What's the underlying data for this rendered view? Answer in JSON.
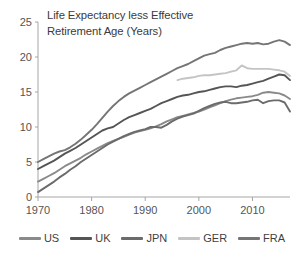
{
  "chart_data": {
    "type": "line",
    "title": "Life Expectancy less Effective\nRetirement Age (Years)",
    "title_line1": "Life Expectancy less Effective",
    "title_line2": "Retirement Age (Years)",
    "xlabel": "",
    "ylabel": "",
    "xlim": [
      1970,
      2017
    ],
    "ylim": [
      0,
      25
    ],
    "ytick_labels": [
      "0",
      "5",
      "10",
      "15",
      "20",
      "25"
    ],
    "ytick_values": [
      0,
      5,
      10,
      15,
      20,
      25
    ],
    "xtick_labels": [
      "1970",
      "1980",
      "1990",
      "2000",
      "2010"
    ],
    "xtick_values": [
      1970,
      1980,
      1990,
      2000,
      2010
    ],
    "grid": false,
    "legend_position": "bottom",
    "series": [
      {
        "name": "US",
        "color": "#8a8a8a",
        "x": [
          1970,
          1971,
          1972,
          1973,
          1974,
          1975,
          1976,
          1977,
          1978,
          1979,
          1980,
          1981,
          1982,
          1983,
          1984,
          1985,
          1986,
          1987,
          1988,
          1989,
          1990,
          1991,
          1992,
          1993,
          1994,
          1995,
          1996,
          1997,
          1998,
          1999,
          2000,
          2001,
          2002,
          2003,
          2004,
          2005,
          2006,
          2007,
          2008,
          2009,
          2010,
          2011,
          2012,
          2013,
          2014,
          2015,
          2016,
          2017
        ],
        "values": [
          2.2,
          2.6,
          3.0,
          3.4,
          3.9,
          4.4,
          4.8,
          5.2,
          5.6,
          6.1,
          6.5,
          6.9,
          7.3,
          7.7,
          8.0,
          8.3,
          8.6,
          8.9,
          9.2,
          9.4,
          9.6,
          9.8,
          10.1,
          10.4,
          10.8,
          11.1,
          11.4,
          11.6,
          11.8,
          12.0,
          12.2,
          12.5,
          12.8,
          13.1,
          13.4,
          13.7,
          13.9,
          14.1,
          14.2,
          14.3,
          14.4,
          14.6,
          14.9,
          15.0,
          14.9,
          14.8,
          14.5,
          14.0
        ]
      },
      {
        "name": "UK",
        "color": "#555555",
        "x": [
          1970,
          1971,
          1972,
          1973,
          1974,
          1975,
          1976,
          1977,
          1978,
          1979,
          1980,
          1981,
          1982,
          1983,
          1984,
          1985,
          1986,
          1987,
          1988,
          1989,
          1990,
          1991,
          1992,
          1993,
          1994,
          1995,
          1996,
          1997,
          1998,
          1999,
          2000,
          2001,
          2002,
          2003,
          2004,
          2005,
          2006,
          2007,
          2008,
          2009,
          2010,
          2011,
          2012,
          2013,
          2014,
          2015,
          2016,
          2017
        ],
        "values": [
          4.0,
          4.4,
          4.8,
          5.2,
          5.7,
          6.2,
          6.6,
          7.0,
          7.5,
          8.0,
          8.5,
          9.0,
          9.5,
          9.8,
          10.0,
          10.5,
          11.0,
          11.4,
          11.7,
          12.0,
          12.3,
          12.6,
          13.0,
          13.4,
          13.7,
          14.0,
          14.3,
          14.5,
          14.6,
          14.8,
          15.0,
          15.1,
          15.3,
          15.5,
          15.7,
          15.8,
          15.8,
          15.7,
          15.9,
          16.0,
          16.2,
          16.4,
          16.6,
          16.9,
          17.2,
          17.5,
          17.4,
          16.7
        ]
      },
      {
        "name": "JPN",
        "color": "#6b6b6b",
        "x": [
          1970,
          1971,
          1972,
          1973,
          1974,
          1975,
          1976,
          1977,
          1978,
          1979,
          1980,
          1981,
          1982,
          1983,
          1984,
          1985,
          1986,
          1987,
          1988,
          1989,
          1990,
          1991,
          1992,
          1993,
          1994,
          1995,
          1996,
          1997,
          1998,
          1999,
          2000,
          2001,
          2002,
          2003,
          2004,
          2005,
          2006,
          2007,
          2008,
          2009,
          2010,
          2011,
          2012,
          2013,
          2014,
          2015,
          2016,
          2017
        ],
        "values": [
          0.7,
          1.2,
          1.7,
          2.2,
          2.8,
          3.3,
          3.9,
          4.4,
          5.0,
          5.5,
          6.0,
          6.5,
          7.0,
          7.5,
          7.9,
          8.3,
          8.7,
          9.0,
          9.3,
          9.5,
          9.7,
          10.0,
          10.0,
          9.9,
          10.3,
          10.8,
          11.2,
          11.5,
          11.7,
          11.9,
          12.3,
          12.7,
          13.0,
          13.3,
          13.5,
          13.6,
          13.4,
          13.4,
          13.5,
          13.6,
          13.8,
          13.9,
          13.4,
          13.7,
          13.8,
          13.8,
          13.5,
          12.2
        ]
      },
      {
        "name": "GER",
        "color": "#c4c4c4",
        "x": [
          1996,
          1997,
          1998,
          1999,
          2000,
          2001,
          2002,
          2003,
          2004,
          2005,
          2006,
          2007,
          2008,
          2009,
          2010,
          2011,
          2012,
          2013,
          2014,
          2015,
          2016,
          2017
        ],
        "values": [
          16.7,
          16.9,
          17.0,
          17.1,
          17.3,
          17.4,
          17.4,
          17.5,
          17.6,
          17.7,
          17.9,
          18.1,
          18.8,
          18.4,
          18.3,
          18.3,
          18.3,
          18.3,
          18.2,
          18.1,
          17.9,
          17.3
        ]
      },
      {
        "name": "FRA",
        "color": "#757575",
        "x": [
          1970,
          1971,
          1972,
          1973,
          1974,
          1975,
          1976,
          1977,
          1978,
          1979,
          1980,
          1981,
          1982,
          1983,
          1984,
          1985,
          1986,
          1987,
          1988,
          1989,
          1990,
          1991,
          1992,
          1993,
          1994,
          1995,
          1996,
          1997,
          1998,
          1999,
          2000,
          2001,
          2002,
          2003,
          2004,
          2005,
          2006,
          2007,
          2008,
          2009,
          2010,
          2011,
          2012,
          2013,
          2014,
          2015,
          2016,
          2017
        ],
        "values": [
          5.0,
          5.4,
          5.8,
          6.2,
          6.5,
          6.7,
          7.1,
          7.6,
          8.2,
          8.9,
          9.6,
          10.4,
          11.3,
          12.2,
          13.0,
          13.7,
          14.3,
          14.8,
          15.2,
          15.6,
          16.0,
          16.4,
          16.8,
          17.2,
          17.6,
          18.0,
          18.4,
          18.7,
          19.0,
          19.4,
          19.8,
          20.2,
          20.4,
          20.6,
          21.0,
          21.3,
          21.5,
          21.7,
          21.9,
          22.0,
          21.9,
          22.0,
          21.8,
          21.9,
          22.2,
          22.4,
          22.2,
          21.7
        ]
      }
    ]
  },
  "legend": {
    "items": [
      {
        "label": "US",
        "color": "#8a8a8a"
      },
      {
        "label": "UK",
        "color": "#555555"
      },
      {
        "label": "JPN",
        "color": "#6b6b6b"
      },
      {
        "label": "GER",
        "color": "#c4c4c4"
      },
      {
        "label": "FRA",
        "color": "#757575"
      }
    ]
  }
}
